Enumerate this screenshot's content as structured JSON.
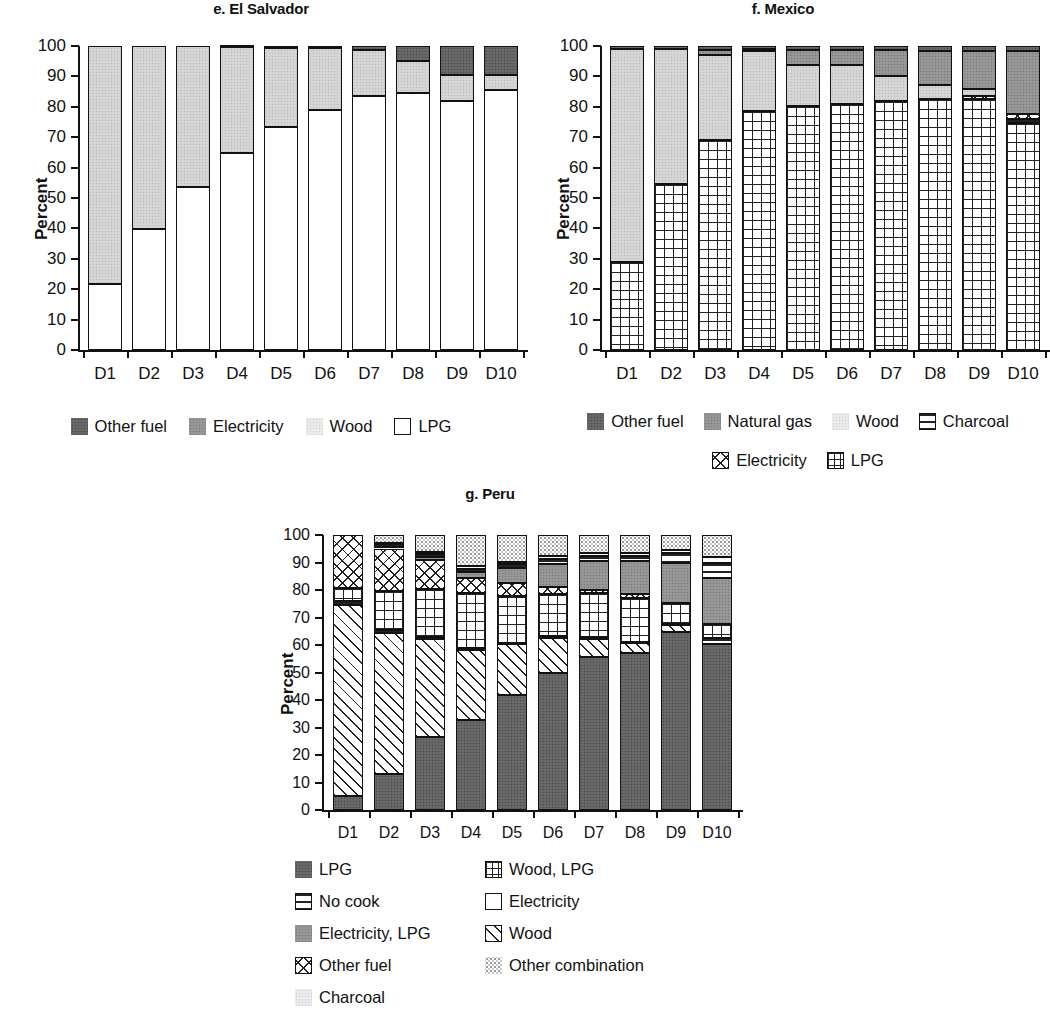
{
  "figure": {
    "axis_label": "Percent",
    "y_ticks": [
      "100",
      "90",
      "80",
      "70",
      "60",
      "50",
      "40",
      "30",
      "20",
      "10",
      "0"
    ],
    "x_categories": [
      "D1",
      "D2",
      "D3",
      "D4",
      "D5",
      "D6",
      "D7",
      "D8",
      "D9",
      "D10"
    ]
  },
  "chart_data": [
    {
      "type": "bar",
      "stacked": true,
      "panel": "e",
      "title": "e. El Salvador",
      "xlabel": "",
      "ylabel": "Percent",
      "ylim": [
        0,
        100
      ],
      "grid": false,
      "legend_position": "bottom",
      "categories": [
        "D1",
        "D2",
        "D3",
        "D4",
        "D5",
        "D6",
        "D7",
        "D8",
        "D9",
        "D10"
      ],
      "legend": [
        "Other fuel",
        "Electricity",
        "Wood",
        "LPG"
      ],
      "series": [
        {
          "name": "LPG",
          "fill": "white",
          "values": [
            21.8,
            39.7,
            53.5,
            64.7,
            73.2,
            79.0,
            83.6,
            84.4,
            82.0,
            85.5
          ]
        },
        {
          "name": "Wood",
          "fill": "light-n",
          "values": [
            78.2,
            60.3,
            46.5,
            34.9,
            26.2,
            20.2,
            15.1,
            10.6,
            8.4,
            5.1
          ]
        },
        {
          "name": "Electricity",
          "fill": "vlight-n",
          "values": [
            0.0,
            0.0,
            0.0,
            0.0,
            0.0,
            0.0,
            0.0,
            0.0,
            0.0,
            0.0
          ]
        },
        {
          "name": "Other fuel",
          "fill": "dark-n",
          "values": [
            0.0,
            0.0,
            0.0,
            0.4,
            0.6,
            0.8,
            1.3,
            5.0,
            9.6,
            9.4
          ]
        }
      ]
    },
    {
      "type": "bar",
      "stacked": true,
      "panel": "f",
      "title": "f. Mexico",
      "xlabel": "",
      "ylabel": "Percent",
      "ylim": [
        0,
        100
      ],
      "grid": false,
      "legend_position": "bottom",
      "categories": [
        "D1",
        "D2",
        "D3",
        "D4",
        "D5",
        "D6",
        "D7",
        "D8",
        "D9",
        "D10"
      ],
      "legend": [
        "Other fuel",
        "Natural gas",
        "Wood",
        "Charcoal",
        "Electricity",
        "LPG"
      ],
      "series": [
        {
          "name": "LPG",
          "fill": "grid",
          "values": [
            29.0,
            54.5,
            69.0,
            78.7,
            80.2,
            80.8,
            82.0,
            82.6,
            82.6,
            74.8
          ]
        },
        {
          "name": "Charcoal",
          "fill": "hlines",
          "values": [
            0.0,
            0.0,
            0.0,
            0.0,
            0.0,
            0.0,
            0.0,
            0.0,
            0.0,
            1.2
          ]
        },
        {
          "name": "Electricity",
          "fill": "cross",
          "values": [
            0.0,
            0.0,
            0.0,
            0.0,
            0.0,
            0.0,
            0.0,
            0.0,
            1.0,
            1.7
          ]
        },
        {
          "name": "Wood",
          "fill": "light-n",
          "values": [
            70.0,
            44.5,
            28.0,
            19.7,
            13.5,
            12.8,
            8.0,
            4.6,
            2.4,
            0.0
          ]
        },
        {
          "name": "Natural gas",
          "fill": "mid-n",
          "values": [
            0.0,
            0.0,
            1.6,
            0.5,
            5.0,
            5.2,
            8.7,
            11.3,
            12.5,
            20.8
          ]
        },
        {
          "name": "Other fuel",
          "fill": "dark-n",
          "values": [
            1.0,
            1.0,
            1.4,
            1.1,
            1.3,
            1.2,
            1.3,
            1.5,
            1.5,
            1.5
          ]
        }
      ]
    },
    {
      "type": "bar",
      "stacked": true,
      "panel": "g",
      "title": "g. Peru",
      "xlabel": "",
      "ylabel": "Percent",
      "ylim": [
        0,
        100
      ],
      "grid": false,
      "legend_position": "bottom",
      "categories": [
        "D1",
        "D2",
        "D3",
        "D4",
        "D5",
        "D6",
        "D7",
        "D8",
        "D9",
        "D10"
      ],
      "legend": [
        "LPG",
        "Wood, LPG",
        "No cook",
        "Electricity",
        "Electricity, LPG",
        "Wood",
        "Other fuel",
        "Other combination",
        "Charcoal"
      ],
      "series": [
        {
          "name": "LPG",
          "fill": "dark-n",
          "values": [
            5.0,
            13.2,
            26.4,
            32.8,
            41.8,
            50.0,
            55.8,
            57.2,
            64.8,
            60.2
          ]
        },
        {
          "name": "Wood",
          "fill": "diag",
          "values": [
            69.5,
            51.3,
            35.8,
            25.5,
            18.5,
            12.5,
            6.5,
            3.5,
            2.5,
            0.0
          ]
        },
        {
          "name": "No cook",
          "fill": "hlines",
          "values": [
            1.5,
            0.8,
            0.8,
            0.6,
            0.6,
            0.6,
            0.5,
            0.5,
            0.5,
            2.5
          ]
        },
        {
          "name": "Wood, LPG",
          "fill": "grid",
          "values": [
            4.8,
            14.5,
            17.5,
            20.0,
            17.0,
            15.5,
            16.0,
            16.0,
            7.5,
            5.0
          ]
        },
        {
          "name": "Other fuel",
          "fill": "cross",
          "values": [
            19.2,
            15.3,
            10.5,
            5.5,
            4.5,
            2.4,
            1.3,
            1.2,
            0.0,
            0.0
          ]
        },
        {
          "name": "Electricity, LPG",
          "fill": "mid-n",
          "values": [
            0.0,
            0.5,
            1.0,
            2.0,
            5.5,
            8.5,
            10.5,
            12.0,
            14.5,
            16.5
          ]
        },
        {
          "name": "No cook 2",
          "fill": "hlines",
          "values": [
            0.0,
            1.0,
            1.2,
            1.4,
            1.4,
            1.6,
            1.6,
            1.8,
            3.6,
            5.5
          ]
        },
        {
          "name": "Electricity",
          "fill": "white",
          "values": [
            0.0,
            0.4,
            0.6,
            0.8,
            1.0,
            1.2,
            1.3,
            1.3,
            1.3,
            2.3
          ]
        },
        {
          "name": "Other combination",
          "fill": "speck",
          "values": [
            0.0,
            3.0,
            6.2,
            11.4,
            9.7,
            7.7,
            6.5,
            6.5,
            5.3,
            8.0
          ]
        }
      ]
    }
  ],
  "legends": {
    "el_salvador": [
      {
        "label": "Other fuel",
        "swatch": "dark-n"
      },
      {
        "label": "Electricity",
        "swatch": "mid-n"
      },
      {
        "label": "Wood",
        "swatch": "vlight-n"
      },
      {
        "label": "LPG",
        "swatch": "white"
      }
    ],
    "mexico": [
      {
        "label": "Other fuel",
        "swatch": "dark-n"
      },
      {
        "label": "Natural gas",
        "swatch": "mid-n"
      },
      {
        "label": "Wood",
        "swatch": "vlight-n"
      },
      {
        "label": "Charcoal",
        "swatch": "hlines"
      },
      {
        "label": "Electricity",
        "swatch": "cross"
      },
      {
        "label": "LPG",
        "swatch": "grid-s"
      }
    ],
    "peru": [
      {
        "label": "LPG",
        "swatch": "dark-n"
      },
      {
        "label": "Wood, LPG",
        "swatch": "grid-s"
      },
      {
        "label": "No cook",
        "swatch": "hlines"
      },
      {
        "label": "Electricity",
        "swatch": "white"
      },
      {
        "label": "Electricity, LPG",
        "swatch": "mid-n"
      },
      {
        "label": "Wood",
        "swatch": "diag"
      },
      {
        "label": "Other fuel",
        "swatch": "cross"
      },
      {
        "label": "Other combination",
        "swatch": "speck"
      },
      {
        "label": "Charcoal",
        "swatch": "vlight-n"
      }
    ]
  }
}
